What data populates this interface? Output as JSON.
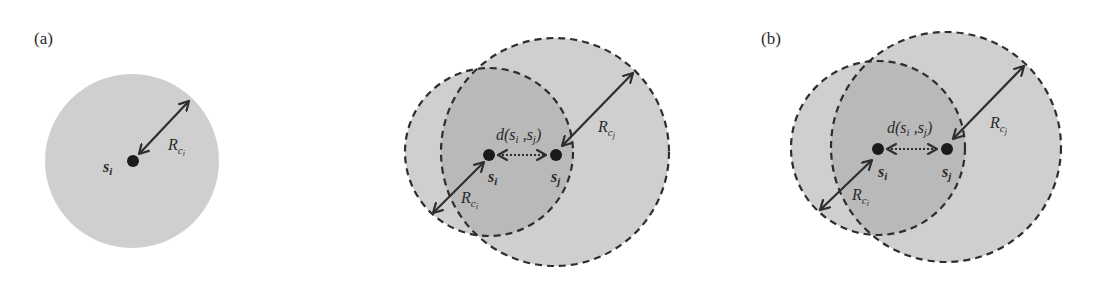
{
  "figure": {
    "panels": [
      {
        "id": "a",
        "label": "(a)",
        "node": "s",
        "node_sub": "i",
        "radius_label": "R",
        "radius_sub": "c",
        "radius_subsub": "i"
      },
      {
        "id": "middle",
        "label": "",
        "node_i": "s",
        "node_i_sub": "i",
        "node_j": "s",
        "node_j_sub": "j",
        "distance_label": "d(s",
        "distance_sub_i": "i",
        "distance_mid": " ,s",
        "distance_sub_j": "j",
        "distance_close": ")",
        "radius_i_label": "R",
        "radius_i_sub": "c",
        "radius_i_subsub": "i",
        "radius_j_label": "R",
        "radius_j_sub": "c",
        "radius_j_subsub": "j"
      },
      {
        "id": "b",
        "label": "(b)",
        "node_i": "s",
        "node_i_sub": "i",
        "node_j": "s",
        "node_j_sub": "j",
        "distance_label": "d(s",
        "distance_sub_i": "i",
        "distance_mid": " ,s",
        "distance_sub_j": "j",
        "distance_close": ")",
        "radius_i_label": "R",
        "radius_i_sub": "c",
        "radius_i_subsub": "i",
        "radius_j_label": "R",
        "radius_j_sub": "c",
        "radius_j_subsub": "j"
      }
    ],
    "colors": {
      "fill": "#cfcfcf",
      "overlap_fill": "#b9b9b9",
      "stroke": "#2e2e2e",
      "background": "#ffffff"
    }
  }
}
